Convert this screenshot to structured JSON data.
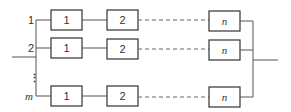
{
  "diagram": {
    "type": "parallel-series reliability block diagram",
    "branches": [
      {
        "label": "1",
        "blocks": [
          "1",
          "2",
          "n"
        ]
      },
      {
        "label": "2",
        "blocks": [
          "1",
          "2",
          "n"
        ]
      },
      {
        "label": "m",
        "blocks": [
          "1",
          "2",
          "n"
        ]
      }
    ],
    "ellipsis": "⋮",
    "colors": {
      "line": "#555555",
      "box_border": "#333333",
      "text": "#333333"
    }
  }
}
